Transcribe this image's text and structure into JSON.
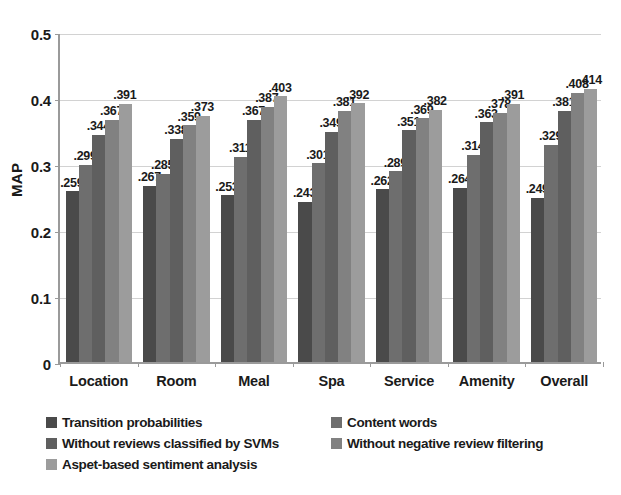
{
  "chart_data": {
    "type": "bar",
    "title": "",
    "xlabel": "",
    "ylabel": "MAP",
    "ylim": [
      0,
      0.5
    ],
    "grid": true,
    "legend_position": "bottom",
    "ytick_labels": [
      "0.5",
      "0.4",
      "0.3",
      "0.2",
      "0.1",
      "0"
    ],
    "ytick_values": [
      0.5,
      0.4,
      0.3,
      0.2,
      0.1,
      0
    ],
    "categories": [
      "Location",
      "Room",
      "Meal",
      "Spa",
      "Service",
      "Amenity",
      "Overall"
    ],
    "series": [
      {
        "name": "Transition probabilities",
        "color": "#4a4a4a",
        "values": [
          0.259,
          0.267,
          0.253,
          0.243,
          0.262,
          0.264,
          0.249
        ],
        "labels": [
          ".259",
          ".267",
          ".253",
          ".243",
          ".262",
          ".264",
          ".249"
        ]
      },
      {
        "name": "Content words",
        "color": "#6e6e6e",
        "values": [
          0.299,
          0.285,
          0.311,
          0.301,
          0.289,
          0.314,
          0.329
        ],
        "labels": [
          ".299",
          ".285",
          ".311",
          ".301",
          ".289",
          ".314",
          ".329"
        ]
      },
      {
        "name": "Without reviews classified by SVMs",
        "color": "#5f5f5f",
        "values": [
          0.344,
          0.338,
          0.367,
          0.349,
          0.351,
          0.363,
          0.381
        ],
        "labels": [
          ".344",
          ".338",
          ".367",
          ".349",
          ".351",
          ".363",
          ".381"
        ]
      },
      {
        "name": "Without negative review filtering",
        "color": "#818181",
        "values": [
          0.367,
          0.359,
          0.387,
          0.381,
          0.369,
          0.378,
          0.408
        ],
        "labels": [
          ".367",
          ".359",
          ".387",
          ".381",
          ".369",
          ".378",
          ".408"
        ]
      },
      {
        "name": "Aspet-based sentiment analysis",
        "color": "#9c9c9c",
        "values": [
          0.391,
          0.373,
          0.403,
          0.392,
          0.382,
          0.391,
          0.414
        ],
        "labels": [
          ".391",
          ".373",
          ".403",
          ".392",
          ".382",
          ".391",
          ".414"
        ]
      }
    ]
  },
  "legend": {
    "rows": [
      [
        {
          "label": "Transition probabilities",
          "color": "#4a4a4a"
        },
        {
          "label": "Content words",
          "color": "#6e6e6e"
        }
      ],
      [
        {
          "label": "Without reviews classified by SVMs",
          "color": "#5f5f5f"
        },
        {
          "label": "Without negative review filtering",
          "color": "#818181"
        }
      ],
      [
        {
          "label": "Aspet-based sentiment analysis",
          "color": "#9c9c9c"
        }
      ]
    ]
  }
}
